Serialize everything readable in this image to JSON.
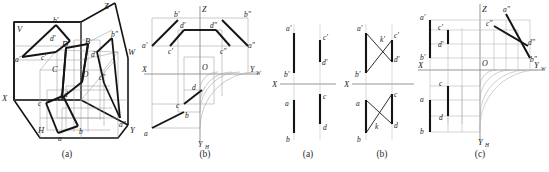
{
  "document": {
    "kind": "descriptive-geometry-figure-plate",
    "panels": 5
  },
  "captions": {
    "panel1": "(a)",
    "panel2": "(b)",
    "panel3": "(a)",
    "panel4": "(b)",
    "panel5": "(c)"
  },
  "panel_pictorial": {
    "name": "three-projection-planes-pictorial",
    "axis_labels": {
      "X": "X",
      "Y": "Y",
      "Z": "Z"
    },
    "plane_labels": {
      "V": "V",
      "H": "H",
      "W": "W"
    },
    "origin_label": "O",
    "space_points": [
      "A",
      "B",
      "C",
      "D"
    ],
    "front_projections": [
      "a'",
      "b'",
      "c'",
      "d'"
    ],
    "top_projections": [
      "a",
      "b",
      "c",
      "d"
    ],
    "side_projections": [
      "a\"",
      "b\"",
      "c\"",
      "d\""
    ]
  },
  "panel_unfolded": {
    "name": "unfolded-three-view-drawing",
    "axis_labels": {
      "X": "X",
      "Z": "Z",
      "Yw": "Y",
      "Yw_sub": "W",
      "Yh": "Y",
      "Yh_sub": "H"
    },
    "origin_label": "O",
    "front_projections": [
      "a'",
      "b'",
      "c'",
      "d'"
    ],
    "top_projections": [
      "a",
      "b",
      "c",
      "d"
    ],
    "side_projections": [
      "a\"",
      "b\"",
      "c\"",
      "d\""
    ]
  },
  "panel_a_small": {
    "name": "two-view-parallel-lines",
    "axis_label": "X",
    "labels": [
      "a'",
      "b'",
      "c'",
      "d'",
      "a",
      "b",
      "c",
      "d"
    ]
  },
  "panel_b_small": {
    "name": "two-view-crossing-lines",
    "axis_label": "X",
    "labels": [
      "a'",
      "b'",
      "c'",
      "d'",
      "k'",
      "a",
      "b",
      "c",
      "d",
      "k"
    ]
  },
  "panel_c_small": {
    "name": "three-view-profile-lines",
    "axis_labels": {
      "X": "X",
      "Z": "Z",
      "Yw": "Y",
      "Yw_sub": "W",
      "Yh": "Y",
      "Yh_sub": "H"
    },
    "origin_label": "O",
    "front_projections": [
      "a'",
      "b'",
      "c'",
      "d'"
    ],
    "top_projections": [
      "a",
      "b",
      "c",
      "d"
    ],
    "side_projections": [
      "a\"",
      "b\"",
      "c\"",
      "d\""
    ]
  },
  "colors": {
    "heavy_line": "#141414",
    "thin_line": "#8a8a8a",
    "construction_line": "#a8a8a8",
    "label_text": "#1a1a1a",
    "background": "#ffffff"
  }
}
